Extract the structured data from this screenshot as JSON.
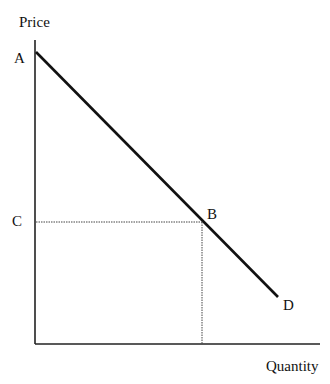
{
  "diagram": {
    "type": "demand curve",
    "axes": {
      "y_label": "Price",
      "x_label": "Quantity"
    },
    "points": {
      "A": "A",
      "B": "B",
      "C": "C",
      "D": "D"
    },
    "line": {
      "from": "A",
      "to": "D",
      "style": "solid"
    },
    "guides": [
      {
        "from": "C",
        "to": "B",
        "style": "dotted"
      },
      {
        "from": "B",
        "to": "x-axis",
        "style": "dotted"
      }
    ]
  }
}
